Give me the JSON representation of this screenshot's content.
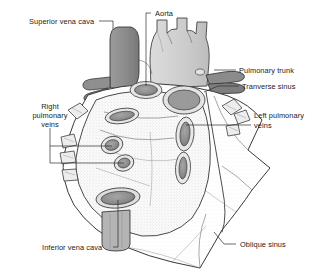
{
  "figure": {
    "background_color": "#ffffff",
    "line_color": "#2e2e2e",
    "text_color": "#1a1a1a",
    "width": 318,
    "height": 273
  },
  "labels": {
    "superior_vena_cava": "Superior vena cava",
    "aorta": "Aorta",
    "pulmonary_trunk": "Pulmonary trunk",
    "transverse_sinus": "Tranverse sinus",
    "right_pulmonary_veins_line1": "Right",
    "right_pulmonary_veins_line2": "pulmonary",
    "right_pulmonary_veins_line3": "veins",
    "left_pulmonary_veins_line1": "Left pulmonary",
    "left_pulmonary_veins_line2": "veins",
    "inferior_vena_cava": "Inferior vena cava",
    "oblique_sinus": "Oblique sinus"
  },
  "structures": {
    "superior_vena_cava_fill": "#8e8e8e",
    "aorta_fill": "#cfcfcf",
    "pulmonary_trunk_fill": "#9a9a9a",
    "pericardium_fill": "#fbfbfb",
    "heart_base_fill": "#f4f4f4",
    "vessel_opening_fill": "#8a8a8a",
    "inferior_vena_cava_fill": "#b6b6b6",
    "vein_stub_fill": "#e8e8e8"
  }
}
